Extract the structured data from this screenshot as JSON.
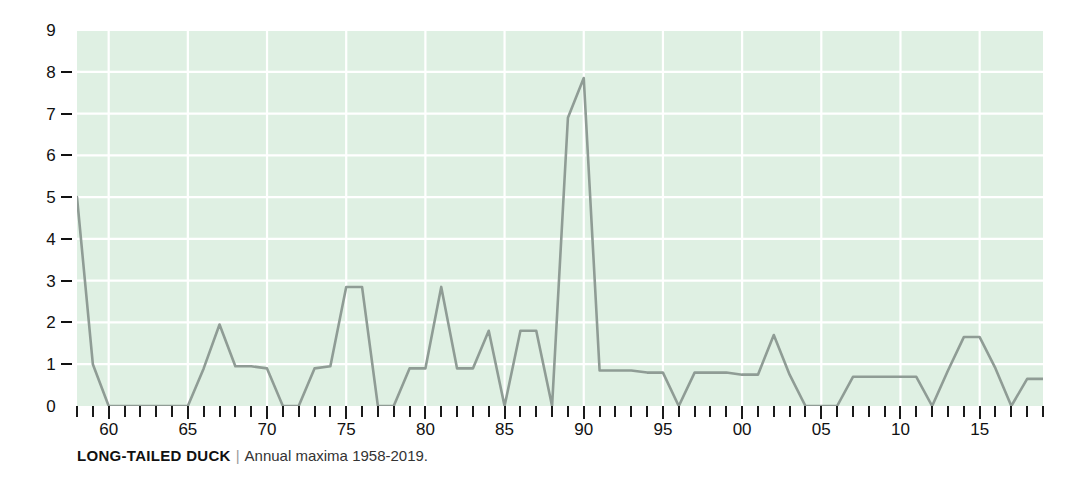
{
  "caption": {
    "title": "LONG-TAILED DUCK",
    "separator": "|",
    "subtitle": "Annual maxima 1958-2019."
  },
  "colors": {
    "plot_background": "#dff0e3",
    "gridline": "#ffffff",
    "line": "#8f9c95",
    "text": "#111111",
    "page_background": "#ffffff"
  },
  "chart_data": {
    "type": "line",
    "title": "LONG-TAILED DUCK",
    "subtitle": "Annual maxima 1958-2019.",
    "xlabel": "",
    "ylabel": "",
    "ylim": [
      0,
      9
    ],
    "xlim": [
      1958,
      2019
    ],
    "grid": true,
    "legend": null,
    "y_ticks": [
      0,
      1,
      2,
      3,
      4,
      5,
      6,
      7,
      8,
      9
    ],
    "y_tick_labels": [
      "0",
      "1",
      "2",
      "3",
      "4",
      "5",
      "6",
      "7",
      "8",
      "9"
    ],
    "x_tick_labels": [
      {
        "year": 1960,
        "label": "60"
      },
      {
        "year": 1965,
        "label": "65"
      },
      {
        "year": 1970,
        "label": "70"
      },
      {
        "year": 1975,
        "label": "75"
      },
      {
        "year": 1980,
        "label": "80"
      },
      {
        "year": 1985,
        "label": "85"
      },
      {
        "year": 1990,
        "label": "90"
      },
      {
        "year": 1995,
        "label": "95"
      },
      {
        "year": 2000,
        "label": "00"
      },
      {
        "year": 2005,
        "label": "05"
      },
      {
        "year": 2010,
        "label": "10"
      },
      {
        "year": 2015,
        "label": "15"
      }
    ],
    "x": [
      1958,
      1959,
      1960,
      1961,
      1962,
      1963,
      1964,
      1965,
      1966,
      1967,
      1968,
      1969,
      1970,
      1971,
      1972,
      1973,
      1974,
      1975,
      1976,
      1977,
      1978,
      1979,
      1980,
      1981,
      1982,
      1983,
      1984,
      1985,
      1986,
      1987,
      1988,
      1989,
      1990,
      1991,
      1992,
      1993,
      1994,
      1995,
      1996,
      1997,
      1998,
      1999,
      2000,
      2001,
      2002,
      2003,
      2004,
      2005,
      2006,
      2007,
      2008,
      2009,
      2010,
      2011,
      2012,
      2013,
      2014,
      2015,
      2016,
      2017,
      2018,
      2019
    ],
    "values": [
      5,
      1,
      0,
      0,
      0,
      0,
      0,
      0,
      0.9,
      1.95,
      0.95,
      0.95,
      0.9,
      0,
      0,
      0.9,
      0.95,
      2.85,
      2.85,
      0,
      0,
      0.9,
      0.9,
      2.85,
      0.9,
      0.9,
      1.8,
      0,
      1.8,
      1.8,
      0,
      6.9,
      7.85,
      0.85,
      0.85,
      0.85,
      0.8,
      0.8,
      0,
      0.8,
      0.8,
      0.8,
      0.75,
      0.75,
      1.7,
      0.75,
      0,
      0,
      0,
      0.7,
      0.7,
      0.7,
      0.7,
      0.7,
      0,
      0.85,
      1.65,
      1.65,
      0.9,
      0,
      0.65,
      0.65
    ]
  }
}
